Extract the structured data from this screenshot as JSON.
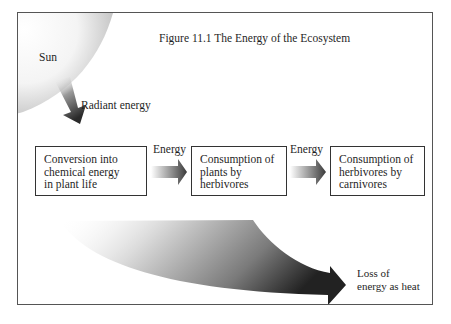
{
  "figure": {
    "title": "Figure 11.1  The Energy of the Ecosystem"
  },
  "labels": {
    "sun": "Sun",
    "radiant_energy": "Radiant energy",
    "energy_1": "Energy",
    "energy_2": "Energy",
    "loss_line1": "Loss of",
    "loss_line2": "energy as heat"
  },
  "boxes": [
    {
      "lines": [
        "Conversion into",
        "chemical energy",
        "in plant life"
      ]
    },
    {
      "lines": [
        "Consumption of",
        "plants by",
        "herbivores"
      ]
    },
    {
      "lines": [
        "Consumption of",
        "herbivores by",
        "carnivores"
      ]
    }
  ],
  "colors": {
    "border": "#555555",
    "text": "#1f1f1f",
    "arrow_dark": "#2a2a2a",
    "gradient_light": "#ffffff"
  }
}
